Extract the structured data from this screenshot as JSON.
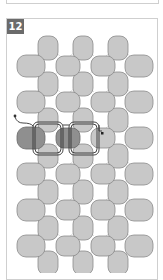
{
  "step": {
    "number": "12"
  },
  "diagram": {
    "colors": {
      "bead_fill": "#c8c8c8",
      "bead_stroke": "#8a8a8a",
      "highlight_bead_fill": "#8f8f8f",
      "thread_light": "#d6d6d6",
      "thread_dark": "#333333",
      "badge_bg": "#6b6b6b",
      "frame": "#cfcfcf"
    },
    "vertical_bead_columns_x": [
      48,
      83,
      118
    ],
    "horizontal_bead_columns_x": [
      32,
      68,
      103,
      140
    ],
    "row_count": 7
  }
}
